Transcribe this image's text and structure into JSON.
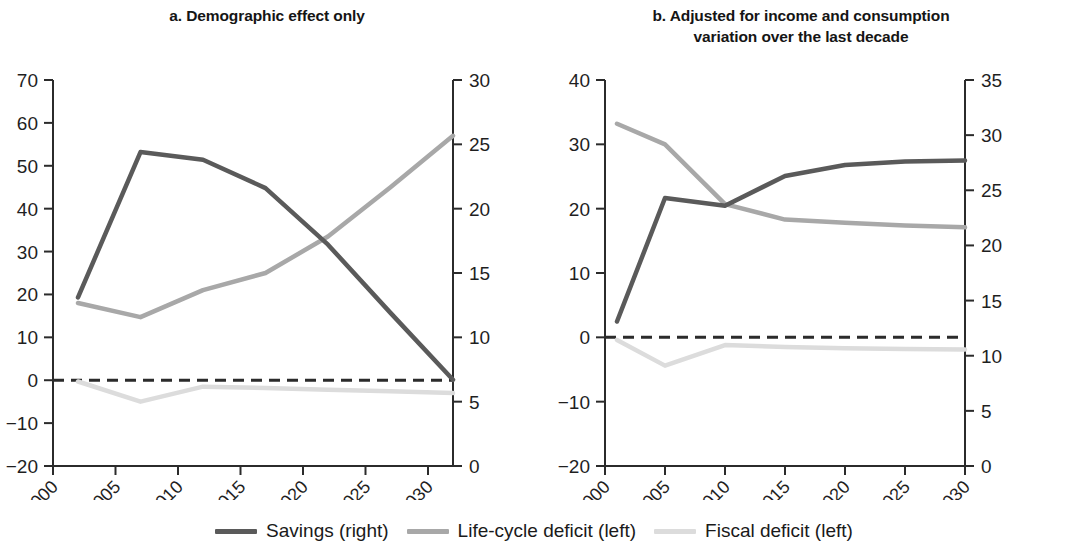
{
  "figure": {
    "background": "#ffffff"
  },
  "legend": {
    "position": "bottom-center",
    "items": [
      {
        "label": "Savings (right)",
        "color": "#5a5a5a",
        "key": "savings"
      },
      {
        "label": "Life-cycle deficit (left)",
        "color": "#a8a8a8",
        "key": "life_cycle_deficit"
      },
      {
        "label": "Fiscal deficit (left)",
        "color": "#dcdcdc",
        "key": "fiscal_deficit"
      }
    ]
  },
  "chart_data": [
    {
      "id": "panel-a",
      "type": "line",
      "title": "a. Demographic effect only",
      "xlabel": "",
      "ylabel": "",
      "grid": false,
      "xlim": [
        2000,
        2032
      ],
      "xticks": [
        2000,
        2005,
        2010,
        2015,
        2020,
        2025,
        2030
      ],
      "xtick_labels": [
        "2000",
        "2005",
        "2010",
        "2015",
        "2020",
        "2025",
        "2030"
      ],
      "left_axis": {
        "lim": [
          -20,
          70
        ],
        "ticks": [
          -20,
          -10,
          0,
          10,
          20,
          30,
          40,
          50,
          60,
          70
        ],
        "tick_labels": [
          "−20",
          "−10",
          "0",
          "10",
          "20",
          "30",
          "40",
          "50",
          "60",
          "70"
        ]
      },
      "right_axis": {
        "lim": [
          0,
          30
        ],
        "ticks": [
          0,
          5,
          10,
          15,
          20,
          25,
          30
        ],
        "tick_labels": [
          "0",
          "5",
          "10",
          "15",
          "20",
          "25",
          "30"
        ]
      },
      "zero_line": {
        "value": 0,
        "axis": "left",
        "style": "dashed",
        "color": "#2b2b2b"
      },
      "series": [
        {
          "name": "Savings (right)",
          "axis": "right",
          "color": "#5a5a5a",
          "width": 4.5,
          "x": [
            2002,
            2007,
            2012,
            2017,
            2022,
            2027,
            2032
          ],
          "values": [
            13.1,
            24.4,
            23.8,
            21.6,
            17.2,
            11.9,
            6.7
          ]
        },
        {
          "name": "Life-cycle deficit (left)",
          "axis": "left",
          "color": "#a8a8a8",
          "width": 4.5,
          "x": [
            2002,
            2007,
            2012,
            2017,
            2022,
            2027,
            2032
          ],
          "values": [
            18.0,
            14.7,
            21.0,
            25.0,
            33.5,
            45.0,
            57.0
          ]
        },
        {
          "name": "Fiscal deficit (left)",
          "axis": "left",
          "color": "#dcdcdc",
          "width": 4.5,
          "x": [
            2002,
            2007,
            2012,
            2017,
            2022,
            2027,
            2032
          ],
          "values": [
            -0.3,
            -5.0,
            -1.5,
            -1.8,
            -2.2,
            -2.6,
            -3.0
          ]
        }
      ]
    },
    {
      "id": "panel-b",
      "type": "line",
      "title": "b. Adjusted for income and consumption variation over the last decade",
      "title_lines": [
        "b. Adjusted for income and consumption",
        "variation over the last decade"
      ],
      "xlabel": "",
      "ylabel": "",
      "grid": false,
      "xlim": [
        2000,
        2030
      ],
      "xticks": [
        2000,
        2005,
        2010,
        2015,
        2020,
        2025,
        2030
      ],
      "xtick_labels": [
        "2000",
        "2005",
        "2010",
        "2015",
        "2020",
        "2025",
        "2030"
      ],
      "left_axis": {
        "lim": [
          -20,
          40
        ],
        "ticks": [
          -20,
          -10,
          0,
          10,
          20,
          30,
          40
        ],
        "tick_labels": [
          "−20",
          "−10",
          "0",
          "10",
          "20",
          "30",
          "40"
        ]
      },
      "right_axis": {
        "lim": [
          0,
          35
        ],
        "ticks": [
          0,
          5,
          10,
          15,
          20,
          25,
          30,
          35
        ],
        "tick_labels": [
          "0",
          "5",
          "10",
          "15",
          "20",
          "25",
          "30",
          "35"
        ]
      },
      "zero_line": {
        "value": 0,
        "axis": "left",
        "style": "dashed",
        "color": "#2b2b2b"
      },
      "series": [
        {
          "name": "Savings (right)",
          "axis": "right",
          "color": "#5a5a5a",
          "width": 4.5,
          "x": [
            2001,
            2005,
            2010,
            2015,
            2020,
            2025,
            2030
          ],
          "values": [
            13.1,
            24.3,
            23.6,
            26.3,
            27.3,
            27.6,
            27.7
          ]
        },
        {
          "name": "Life-cycle deficit (left)",
          "axis": "left",
          "color": "#a8a8a8",
          "width": 4.5,
          "x": [
            2001,
            2005,
            2010,
            2015,
            2020,
            2025,
            2030
          ],
          "values": [
            33.2,
            30.0,
            20.7,
            18.3,
            17.8,
            17.4,
            17.1
          ]
        },
        {
          "name": "Fiscal deficit (left)",
          "axis": "left",
          "color": "#dcdcdc",
          "width": 4.5,
          "x": [
            2001,
            2005,
            2010,
            2015,
            2020,
            2025,
            2030
          ],
          "values": [
            -0.4,
            -4.4,
            -1.2,
            -1.5,
            -1.7,
            -1.8,
            -1.9
          ]
        }
      ]
    }
  ]
}
